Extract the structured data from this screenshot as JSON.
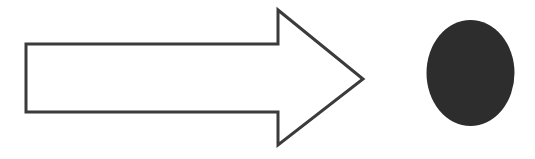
{
  "canvas": {
    "width": 535,
    "height": 159,
    "background_color": "#ffffff",
    "title": "Shapes"
  },
  "shapes": [
    {
      "id": "block-arrow-right",
      "label": "Right-pointing block arrow",
      "kind": "polygon-outline",
      "fill_color": "#ffffff",
      "stroke_color": "#3b3b3b",
      "stroke_width": 3,
      "points": "26,44 278,44 278,10 363,79 278,145 278,112 26,112",
      "tail": {
        "left_x": 26,
        "top_y": 44,
        "bottom_y": 112,
        "right_x": 278,
        "height": 68
      },
      "head": {
        "top_vertex_x": 278,
        "top_vertex_y": 10,
        "tip_x": 363,
        "tip_y": 79,
        "bottom_vertex_x": 278,
        "bottom_vertex_y": 145,
        "height": 135
      }
    },
    {
      "id": "filled-ellipse",
      "label": "Filled dark ellipse",
      "kind": "ellipse-filled",
      "fill_color": "#2d2d2d",
      "stroke_color": "none",
      "stroke_width": 0,
      "center_x": 470.5,
      "center_y": 73,
      "radius_x": 44,
      "radius_y": 53
    }
  ]
}
